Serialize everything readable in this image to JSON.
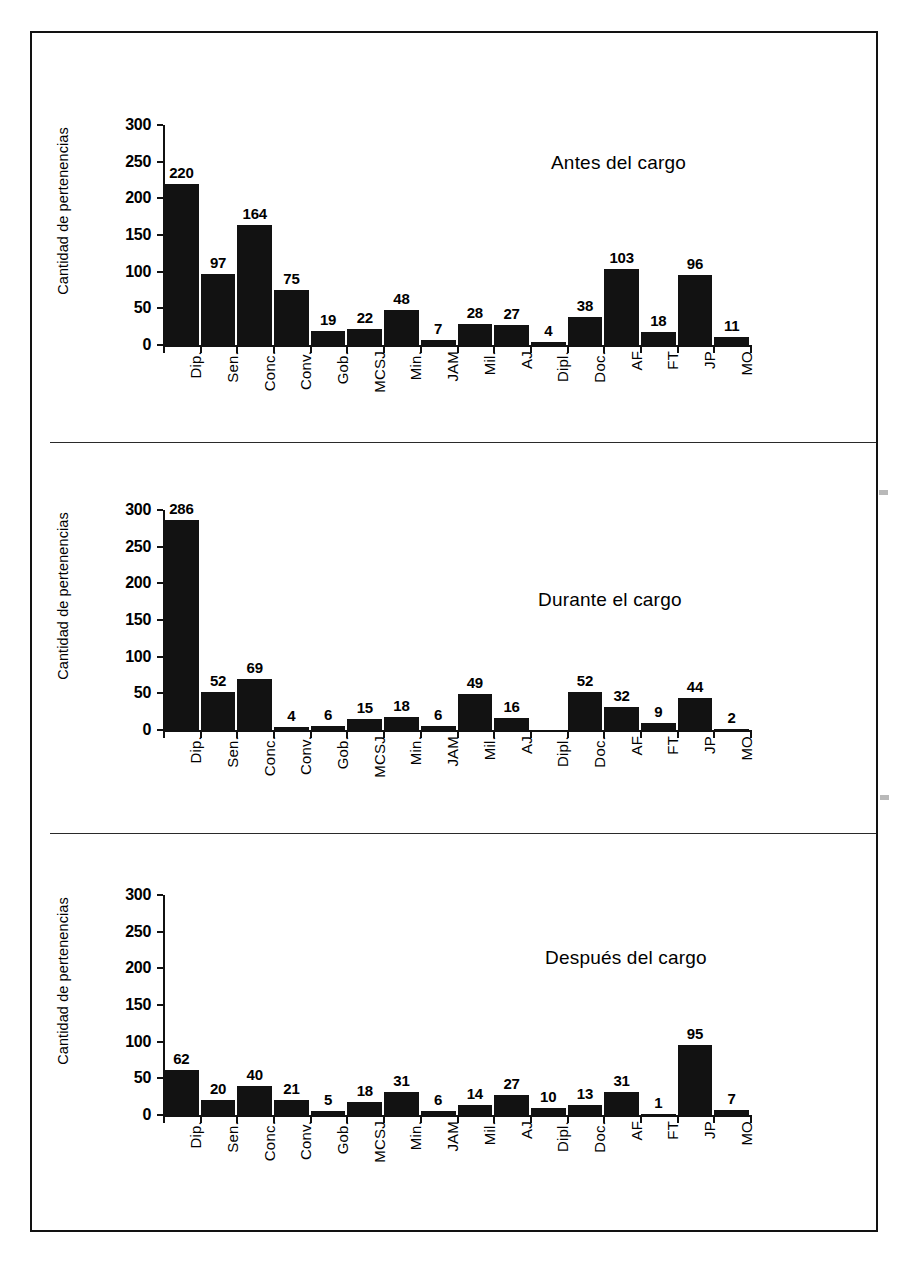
{
  "figure": {
    "y_axis_title": "Cantidad de pertenencias",
    "y_ticks": [
      "0",
      "50",
      "100",
      "150",
      "200",
      "250",
      "300"
    ],
    "categories": [
      "Dip.",
      "Sen.",
      "Conc.",
      "Conv.",
      "Gob.",
      "MCSJ",
      "Min.",
      "JAM",
      "Mil.",
      "AJ",
      "Dipl.",
      "Doc.",
      "AF",
      "FT",
      "JP",
      "MO"
    ],
    "panel_titles": [
      "Antes del cargo",
      "Durante el cargo",
      "Después del cargo"
    ],
    "border_color": "#121212",
    "bar_color": "#121212"
  },
  "chart_data": [
    {
      "type": "bar",
      "title": "Antes del cargo",
      "xlabel": "",
      "ylabel": "Cantidad de pertenencias",
      "ylim": [
        0,
        300
      ],
      "yticks": [
        0,
        50,
        100,
        150,
        200,
        250,
        300
      ],
      "grid": false,
      "legend": "none",
      "categories": [
        "Dip.",
        "Sen.",
        "Conc.",
        "Conv.",
        "Gob.",
        "MCSJ",
        "Min.",
        "JAM",
        "Mil.",
        "AJ",
        "Dipl.",
        "Doc.",
        "AF",
        "FT",
        "JP",
        "MO"
      ],
      "values": [
        220,
        97,
        164,
        75,
        19,
        22,
        48,
        7,
        28,
        27,
        4,
        38,
        103,
        18,
        96,
        11
      ],
      "data_labels": [
        "220",
        "97",
        "164",
        "75",
        "19",
        "22",
        "48",
        "7",
        "28",
        "27",
        "4",
        "38",
        "103",
        "18",
        "96",
        "11"
      ]
    },
    {
      "type": "bar",
      "title": "Durante el cargo",
      "xlabel": "",
      "ylabel": "Cantidad de pertenencias",
      "ylim": [
        0,
        300
      ],
      "yticks": [
        0,
        50,
        100,
        150,
        200,
        250,
        300
      ],
      "grid": false,
      "legend": "none",
      "categories": [
        "Dip.",
        "Sen.",
        "Conc.",
        "Conv.",
        "Gob.",
        "MCSJ",
        "Min.",
        "JAM",
        "Mil.",
        "AJ",
        "Dipl.",
        "Doc.",
        "AF",
        "FT",
        "JP",
        "MO"
      ],
      "values": [
        286,
        52,
        69,
        4,
        6,
        15,
        18,
        6,
        49,
        16,
        0,
        52,
        32,
        9,
        44,
        2
      ],
      "data_labels": [
        "286",
        "52",
        "69",
        "4",
        "6",
        "15",
        "18",
        "6",
        "49",
        "16",
        "",
        "52",
        "32",
        "9",
        "44",
        "2"
      ]
    },
    {
      "type": "bar",
      "title": "Después del cargo",
      "xlabel": "",
      "ylabel": "Cantidad de pertenencias",
      "ylim": [
        0,
        300
      ],
      "yticks": [
        0,
        50,
        100,
        150,
        200,
        250,
        300
      ],
      "grid": false,
      "legend": "none",
      "categories": [
        "Dip.",
        "Sen.",
        "Conc.",
        "Conv.",
        "Gob.",
        "MCSJ",
        "Min.",
        "JAM",
        "Mil.",
        "AJ",
        "Dipl.",
        "Doc.",
        "AF",
        "FT",
        "JP",
        "MO"
      ],
      "values": [
        62,
        20,
        40,
        21,
        5,
        18,
        31,
        6,
        14,
        27,
        10,
        13,
        31,
        1,
        95,
        7
      ],
      "data_labels": [
        "62",
        "20",
        "40",
        "21",
        "5",
        "18",
        "31",
        "6",
        "14",
        "27",
        "10",
        "13",
        "31",
        "1",
        "95",
        "7"
      ]
    }
  ]
}
